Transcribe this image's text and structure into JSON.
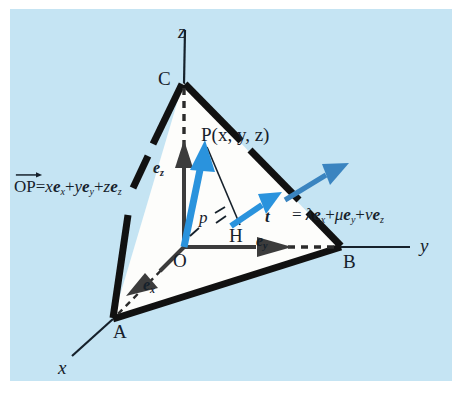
{
  "figure": {
    "background_color": "#c5e4f3",
    "plane_fill_color": "#fdfdfb",
    "plane_edge_color": "#111111",
    "vector_blue_color": "#2a93dd",
    "vector_dark_color": "#3c3c3c",
    "axis_color": "#16212b"
  },
  "axes": [
    {
      "name": "x",
      "label": "x"
    },
    {
      "name": "y",
      "label": "y"
    },
    {
      "name": "z",
      "label": "z"
    }
  ],
  "points": [
    {
      "name": "origin",
      "label": "O"
    },
    {
      "name": "vertex-a",
      "label": "A"
    },
    {
      "name": "vertex-b",
      "label": "B"
    },
    {
      "name": "vertex-c",
      "label": "C"
    },
    {
      "name": "point-p",
      "label": "P(x, y, z)"
    },
    {
      "name": "foot-h",
      "label": "H"
    }
  ],
  "basis_vectors": [
    {
      "name": "e-x",
      "base": "e",
      "sub": "x"
    },
    {
      "name": "e-y",
      "base": "e",
      "sub": "y"
    },
    {
      "name": "e-z",
      "base": "e",
      "sub": "z"
    }
  ],
  "annotations": {
    "p_marker": "p",
    "t_symbol": "t"
  },
  "equations": {
    "position_vector": {
      "lhs_vec": "OP",
      "eq": "=",
      "term1_coeff": "x",
      "term1_base": "e",
      "term1_sub": "x",
      "plus1": "+",
      "term2_coeff": "y",
      "term2_base": "e",
      "term2_sub": "y",
      "plus2": "+",
      "term3_coeff": "z",
      "term3_base": "e",
      "term3_sub": "z"
    },
    "direction_vector": {
      "lhs": "t",
      "eq": "=",
      "term1_coeff": "λ",
      "term1_base": "e",
      "term1_sub": "x",
      "plus1": "+",
      "term2_coeff": "μ",
      "term2_base": "e",
      "term2_sub": "y",
      "plus2": "+",
      "term3_coeff": "ν",
      "term3_base": "e",
      "term3_sub": "z"
    }
  }
}
